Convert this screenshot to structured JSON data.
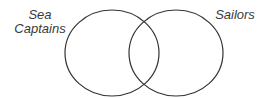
{
  "diagram": {
    "type": "venn",
    "sets": [
      {
        "label_line1": "Sea",
        "label_line2": "Captains"
      },
      {
        "label_line1": "Sailors"
      }
    ],
    "stroke_color": "#333333"
  }
}
